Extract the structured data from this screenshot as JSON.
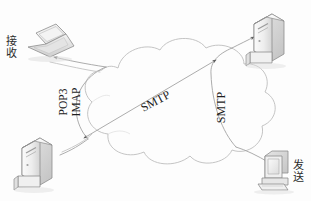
{
  "diagram": {
    "background_color": "#fdfdfd",
    "cloud": {
      "name": "network-cloud",
      "stroke_color": "#b8b8b8",
      "fill_color": "#fcfcfc"
    },
    "nodes": [
      {
        "id": "receiver-laptop",
        "icon": "laptop-icon",
        "label": "接收",
        "label_meaning": "Receive",
        "position": "top-left"
      },
      {
        "id": "receiving-mail-server",
        "icon": "server-icon",
        "label": "",
        "position": "top-right"
      },
      {
        "id": "sending-mail-server",
        "icon": "server-icon",
        "label": "",
        "position": "bottom-left"
      },
      {
        "id": "sender-desktop",
        "icon": "desktop-pc-icon",
        "label": "发送",
        "label_meaning": "Send",
        "position": "bottom-right"
      }
    ],
    "protocol_labels": [
      {
        "id": "pop3",
        "text": "POP3",
        "orientation": "vertical-up"
      },
      {
        "id": "imap",
        "text": "IMAP",
        "orientation": "vertical-up"
      },
      {
        "id": "smtp-center",
        "text": "SMTP",
        "orientation": "diagonal"
      },
      {
        "id": "smtp-right",
        "text": "SMTP",
        "orientation": "vertical-up"
      }
    ],
    "connections": [
      {
        "from": "sender-desktop",
        "to": "sending-mail-server-right",
        "protocol": "SMTP",
        "arrow": true
      },
      {
        "from": "sending-mail-server-right",
        "to": "receiving-mail-server-left",
        "protocol": "SMTP",
        "arrow": true
      },
      {
        "from": "receiving-mail-server-left",
        "to": "receiver-laptop",
        "protocol": "POP3 / IMAP",
        "arrow": true
      }
    ],
    "line_color": "#9a9a9a",
    "text_color": "#2b2b2b"
  }
}
